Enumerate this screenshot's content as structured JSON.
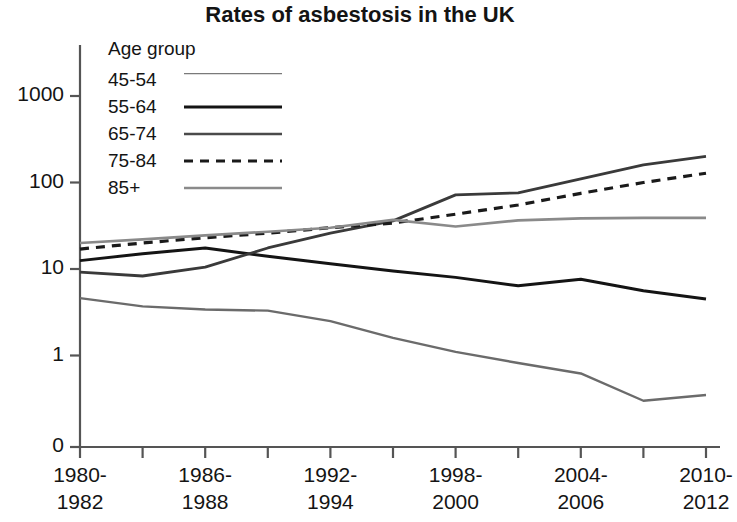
{
  "chart_data": {
    "type": "line",
    "title": "Rates of asbestosis in the UK",
    "xlabel": "",
    "ylabel": "Rate per million",
    "yscale": "log",
    "grid": false,
    "legend_position": "upper-left-inside",
    "legend_title": "Age group",
    "yticks": [
      "1000",
      "100",
      "10",
      "1",
      "0"
    ],
    "ytick_values": [
      1000,
      100,
      10,
      1,
      0
    ],
    "ylim": [
      0.2,
      2000
    ],
    "categories": [
      "1980-\n1982",
      "1983-\n1985",
      "1986-\n1988",
      "1989-\n1991",
      "1992-\n1994",
      "1995-\n1997",
      "1998-\n2000",
      "2001-\n2003",
      "2004-\n2006",
      "2007-\n2009",
      "2010-\n2012"
    ],
    "xtick_labels": [
      {
        "line1": "1980-",
        "line2": "1982"
      },
      {
        "line1": "1986-",
        "line2": "1988"
      },
      {
        "line1": "1992-",
        "line2": "1994"
      },
      {
        "line1": "1998-",
        "line2": "2000"
      },
      {
        "line1": "2004-",
        "line2": "2006"
      },
      {
        "line1": "2010-",
        "line2": "2012"
      }
    ],
    "series": [
      {
        "name": "45-54",
        "color": "#6b6b6b",
        "width": 2.4,
        "dash": "none",
        "values": [
          4.6,
          3.7,
          3.4,
          3.3,
          2.5,
          1.6,
          1.1,
          0.82,
          0.62,
          0.3,
          0.35
        ]
      },
      {
        "name": "55-64",
        "color": "#141414",
        "width": 3.0,
        "dash": "none",
        "values": [
          12.5,
          15.0,
          17.5,
          14.0,
          11.5,
          9.5,
          8.0,
          6.4,
          7.6,
          5.6,
          4.5
        ]
      },
      {
        "name": "65-74",
        "color": "#3a3a3a",
        "width": 2.8,
        "dash": "none",
        "values": [
          9.2,
          8.3,
          10.5,
          17.5,
          26.0,
          36.0,
          72.0,
          76.0,
          110.0,
          160.0,
          200.0
        ]
      },
      {
        "name": "75-84",
        "color": "#1a1a1a",
        "width": 3.2,
        "dash": "9,7",
        "values": [
          17.0,
          20.0,
          23.0,
          26.0,
          30.0,
          34.0,
          43.0,
          55.0,
          75.0,
          100.0,
          128.0
        ]
      },
      {
        "name": "85+",
        "color": "#8a8a8a",
        "width": 2.6,
        "dash": "none",
        "values": [
          20.0,
          22.0,
          24.5,
          27.0,
          30.0,
          37.0,
          31.0,
          36.5,
          38.5,
          39.0,
          39.0
        ]
      }
    ]
  },
  "axis": {
    "zero_label": "0"
  }
}
